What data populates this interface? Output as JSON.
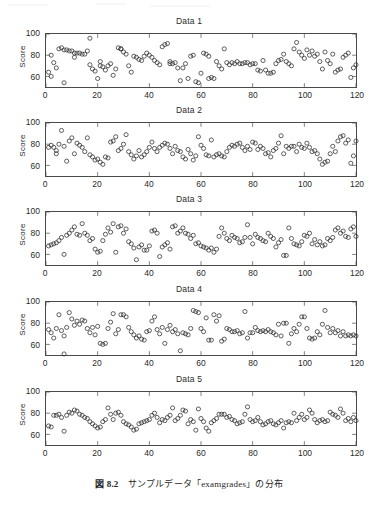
{
  "figure": {
    "caption_number": "図 8.2",
    "caption_text": "サンプルデータ「examgrades」の分布",
    "background_color": "#ffffff",
    "axis_color": "#4a4a4a",
    "marker_color": "#333333",
    "marker_shape": "open-circle"
  },
  "axis": {
    "ylabel": "Score",
    "yticks": [
      "60",
      "80",
      "100"
    ],
    "ytick_values": [
      60,
      80,
      100
    ],
    "xticks": [
      "0",
      "20",
      "40",
      "60",
      "80",
      "100",
      "120"
    ],
    "xtick_values": [
      0,
      20,
      40,
      60,
      80,
      100,
      120
    ],
    "xlim": [
      0,
      120
    ],
    "ylim": [
      50,
      100
    ],
    "grid": false
  },
  "chart_data": [
    {
      "type": "scatter",
      "title": "Data 1",
      "xlabel": "",
      "ylabel": "Score",
      "xlim": [
        0,
        120
      ],
      "ylim": [
        50,
        100
      ],
      "grid": false,
      "x": [
        1,
        2,
        2,
        3,
        4,
        5,
        6,
        7,
        7,
        8,
        9,
        10,
        11,
        11,
        12,
        13,
        14,
        15,
        16,
        17,
        17,
        18,
        19,
        20,
        21,
        21,
        22,
        23,
        24,
        25,
        26,
        27,
        28,
        29,
        29,
        30,
        31,
        32,
        33,
        34,
        35,
        36,
        37,
        38,
        39,
        40,
        41,
        42,
        43,
        44,
        45,
        46,
        47,
        48,
        48,
        49,
        50,
        51,
        52,
        53,
        54,
        55,
        56,
        57,
        58,
        59,
        60,
        61,
        62,
        63,
        63,
        64,
        65,
        66,
        67,
        68,
        69,
        70,
        71,
        72,
        73,
        74,
        75,
        76,
        77,
        78,
        79,
        80,
        81,
        82,
        83,
        84,
        85,
        86,
        87,
        88,
        89,
        90,
        91,
        92,
        93,
        94,
        95,
        96,
        97,
        98,
        99,
        100,
        101,
        102,
        103,
        104,
        105,
        106,
        107,
        108,
        109,
        110,
        111,
        112,
        113,
        114,
        115,
        116,
        117,
        118,
        119,
        120
      ],
      "y": [
        64,
        60,
        80,
        73,
        68,
        86,
        87,
        54,
        85,
        85,
        84,
        84,
        82,
        78,
        82,
        82,
        81,
        81,
        84,
        96,
        71,
        67,
        65,
        58,
        74,
        70,
        69,
        66,
        70,
        72,
        61,
        67,
        87,
        86,
        86,
        83,
        81,
        70,
        64,
        79,
        78,
        76,
        75,
        79,
        82,
        80,
        78,
        75,
        73,
        71,
        88,
        90,
        91,
        74,
        72,
        72,
        73,
        68,
        56,
        68,
        72,
        58,
        79,
        80,
        55,
        54,
        63,
        82,
        81,
        79,
        58,
        59,
        58,
        74,
        70,
        67,
        86,
        73,
        71,
        73,
        72,
        74,
        72,
        72,
        73,
        73,
        71,
        72,
        72,
        66,
        65,
        75,
        66,
        63,
        63,
        64,
        72,
        75,
        76,
        81,
        74,
        72,
        70,
        86,
        92,
        83,
        80,
        77,
        85,
        80,
        84,
        79,
        81,
        74,
        67,
        83,
        75,
        72,
        81,
        64,
        66,
        67,
        78,
        80,
        82,
        59,
        68,
        71
      ]
    },
    {
      "type": "scatter",
      "title": "Data 2",
      "xlabel": "",
      "ylabel": "Score",
      "xlim": [
        0,
        120
      ],
      "ylim": [
        50,
        100
      ],
      "grid": false,
      "x": [
        1,
        2,
        3,
        4,
        4,
        5,
        6,
        7,
        8,
        9,
        10,
        11,
        12,
        13,
        14,
        15,
        16,
        17,
        18,
        19,
        20,
        21,
        22,
        23,
        24,
        25,
        26,
        27,
        28,
        29,
        30,
        31,
        32,
        33,
        34,
        35,
        36,
        37,
        38,
        39,
        40,
        41,
        42,
        43,
        44,
        45,
        46,
        47,
        48,
        49,
        50,
        51,
        52,
        53,
        54,
        55,
        56,
        57,
        58,
        59,
        60,
        61,
        62,
        63,
        64,
        65,
        66,
        67,
        68,
        69,
        70,
        71,
        72,
        73,
        74,
        75,
        76,
        77,
        78,
        79,
        80,
        81,
        82,
        83,
        84,
        85,
        86,
        87,
        88,
        89,
        90,
        91,
        92,
        93,
        94,
        95,
        96,
        97,
        98,
        99,
        100,
        101,
        102,
        103,
        104,
        105,
        106,
        107,
        108,
        109,
        110,
        111,
        112,
        113,
        114,
        115,
        116,
        117,
        118,
        119,
        120
      ],
      "y": [
        77,
        79,
        77,
        74,
        71,
        80,
        93,
        78,
        64,
        83,
        86,
        71,
        81,
        79,
        77,
        73,
        86,
        70,
        68,
        65,
        66,
        63,
        61,
        68,
        67,
        82,
        83,
        87,
        74,
        76,
        80,
        89,
        73,
        70,
        66,
        69,
        74,
        68,
        70,
        73,
        77,
        82,
        76,
        73,
        77,
        79,
        81,
        80,
        76,
        71,
        78,
        74,
        73,
        68,
        66,
        75,
        71,
        65,
        69,
        87,
        79,
        76,
        70,
        69,
        84,
        68,
        70,
        71,
        69,
        68,
        73,
        77,
        79,
        78,
        80,
        81,
        77,
        74,
        78,
        75,
        82,
        81,
        75,
        78,
        76,
        71,
        72,
        68,
        74,
        76,
        81,
        88,
        71,
        78,
        76,
        78,
        78,
        73,
        80,
        77,
        76,
        81,
        77,
        73,
        74,
        71,
        66,
        61,
        63,
        64,
        71,
        78,
        73,
        83,
        87,
        88,
        81,
        84,
        62,
        69,
        83
      ]
    },
    {
      "type": "scatter",
      "title": "Data 3",
      "xlabel": "",
      "ylabel": "Score",
      "xlim": [
        0,
        120
      ],
      "ylim": [
        50,
        100
      ],
      "grid": false,
      "x": [
        1,
        2,
        3,
        4,
        5,
        6,
        7,
        8,
        9,
        10,
        11,
        12,
        13,
        14,
        15,
        16,
        17,
        18,
        19,
        20,
        21,
        22,
        23,
        24,
        25,
        26,
        27,
        28,
        29,
        30,
        31,
        32,
        33,
        34,
        35,
        36,
        37,
        38,
        39,
        40,
        41,
        42,
        43,
        44,
        45,
        46,
        47,
        48,
        49,
        50,
        51,
        52,
        53,
        54,
        55,
        56,
        57,
        58,
        59,
        60,
        61,
        62,
        63,
        64,
        65,
        66,
        67,
        68,
        69,
        70,
        71,
        72,
        73,
        74,
        75,
        76,
        77,
        78,
        79,
        80,
        81,
        82,
        83,
        84,
        85,
        86,
        87,
        88,
        89,
        90,
        91,
        92,
        93,
        94,
        95,
        96,
        97,
        98,
        99,
        100,
        101,
        102,
        103,
        104,
        105,
        106,
        107,
        108,
        109,
        110,
        111,
        112,
        113,
        114,
        115,
        116,
        117,
        118,
        119,
        120
      ],
      "y": [
        68,
        69,
        70,
        71,
        73,
        76,
        60,
        78,
        80,
        83,
        86,
        79,
        78,
        89,
        80,
        78,
        73,
        75,
        65,
        62,
        63,
        73,
        79,
        85,
        81,
        89,
        62,
        86,
        87,
        80,
        84,
        72,
        70,
        66,
        55,
        67,
        69,
        64,
        64,
        68,
        82,
        83,
        80,
        58,
        67,
        69,
        71,
        65,
        86,
        87,
        80,
        82,
        85,
        80,
        79,
        75,
        78,
        70,
        71,
        68,
        67,
        66,
        64,
        66,
        62,
        65,
        77,
        85,
        80,
        75,
        73,
        78,
        76,
        75,
        71,
        72,
        76,
        88,
        76,
        70,
        79,
        76,
        75,
        73,
        72,
        80,
        77,
        75,
        67,
        71,
        74,
        59,
        59,
        85,
        75,
        70,
        69,
        68,
        72,
        78,
        77,
        80,
        70,
        74,
        69,
        72,
        68,
        69,
        75,
        73,
        76,
        83,
        85,
        80,
        82,
        77,
        76,
        84,
        86,
        77
      ]
    },
    {
      "type": "scatter",
      "title": "Data 4",
      "xlabel": "",
      "ylabel": "Score",
      "xlim": [
        0,
        100
      ],
      "ylim": [
        50,
        100
      ],
      "grid": false,
      "x": [
        1,
        2,
        3,
        4,
        5,
        6,
        7,
        7,
        8,
        9,
        10,
        11,
        12,
        13,
        14,
        15,
        16,
        17,
        18,
        19,
        20,
        21,
        22,
        23,
        24,
        25,
        26,
        27,
        28,
        29,
        30,
        31,
        32,
        33,
        34,
        35,
        36,
        37,
        38,
        39,
        40,
        41,
        42,
        43,
        44,
        45,
        46,
        47,
        48,
        49,
        50,
        51,
        52,
        53,
        54,
        55,
        56,
        57,
        58,
        59,
        60,
        61,
        62,
        63,
        64,
        65,
        66,
        67,
        68,
        69,
        70,
        71,
        72,
        73,
        74,
        75,
        76,
        77,
        78,
        79,
        80,
        81,
        82,
        83,
        84,
        85,
        86,
        87,
        88,
        89,
        90,
        91,
        92,
        93,
        94,
        95,
        96,
        97,
        98,
        99,
        100,
        101,
        102,
        103,
        104,
        105,
        106,
        107,
        108,
        109,
        110,
        111,
        112,
        113,
        114,
        115,
        116,
        117,
        118,
        119,
        120
      ],
      "y": [
        74,
        71,
        66,
        75,
        88,
        73,
        68,
        51,
        76,
        90,
        84,
        78,
        82,
        79,
        83,
        82,
        75,
        71,
        76,
        69,
        77,
        61,
        60,
        61,
        75,
        81,
        89,
        70,
        74,
        88,
        88,
        86,
        76,
        72,
        69,
        66,
        68,
        65,
        64,
        72,
        73,
        82,
        86,
        74,
        70,
        76,
        61,
        74,
        78,
        72,
        74,
        70,
        54,
        71,
        70,
        69,
        75,
        92,
        91,
        90,
        75,
        72,
        85,
        64,
        64,
        88,
        82,
        87,
        63,
        65,
        75,
        74,
        72,
        72,
        73,
        70,
        71,
        91,
        66,
        71,
        71,
        76,
        73,
        72,
        73,
        72,
        74,
        72,
        71,
        69,
        79,
        68,
        80,
        80,
        61,
        70,
        75,
        72,
        79,
        86,
        86,
        75,
        66,
        65,
        66,
        72,
        69,
        79,
        92,
        76,
        71,
        75,
        71,
        73,
        68,
        72,
        68,
        69,
        68,
        69,
        68
      ]
    },
    {
      "type": "scatter",
      "title": "Data 5",
      "xlabel": "",
      "ylabel": "Score",
      "xlim": [
        0,
        100
      ],
      "ylim": [
        50,
        100
      ],
      "grid": false,
      "x": [
        1,
        2,
        3,
        4,
        5,
        6,
        7,
        8,
        9,
        10,
        11,
        12,
        13,
        14,
        15,
        16,
        17,
        18,
        19,
        20,
        21,
        22,
        23,
        24,
        25,
        26,
        27,
        28,
        29,
        30,
        31,
        32,
        33,
        34,
        35,
        36,
        37,
        38,
        39,
        40,
        41,
        42,
        43,
        44,
        45,
        46,
        47,
        48,
        49,
        50,
        51,
        52,
        53,
        54,
        55,
        56,
        57,
        58,
        59,
        60,
        61,
        62,
        63,
        64,
        65,
        66,
        67,
        68,
        69,
        70,
        71,
        72,
        73,
        74,
        75,
        76,
        77,
        78,
        79,
        80,
        81,
        82,
        83,
        84,
        85,
        86,
        87,
        88,
        89,
        90,
        91,
        92,
        93,
        94,
        95,
        96,
        97,
        98,
        99,
        100,
        101,
        102,
        103,
        104,
        105,
        106,
        107,
        108,
        109,
        110,
        111,
        112,
        113,
        114,
        115,
        116,
        117,
        118,
        119,
        120
      ],
      "y": [
        68,
        67,
        78,
        78,
        79,
        76,
        63,
        78,
        81,
        80,
        83,
        82,
        79,
        78,
        76,
        75,
        72,
        70,
        68,
        66,
        67,
        72,
        74,
        85,
        79,
        74,
        80,
        81,
        78,
        72,
        70,
        69,
        67,
        64,
        65,
        70,
        71,
        72,
        73,
        74,
        78,
        80,
        76,
        71,
        74,
        73,
        76,
        78,
        85,
        73,
        75,
        78,
        83,
        82,
        70,
        74,
        72,
        64,
        84,
        75,
        72,
        66,
        63,
        71,
        73,
        75,
        79,
        79,
        79,
        76,
        77,
        74,
        73,
        70,
        71,
        72,
        79,
        86,
        74,
        72,
        73,
        76,
        72,
        69,
        70,
        72,
        73,
        70,
        69,
        71,
        73,
        66,
        71,
        72,
        71,
        80,
        73,
        76,
        79,
        74,
        76,
        83,
        80,
        74,
        71,
        73,
        74,
        72,
        73,
        81,
        79,
        78,
        76,
        84,
        80,
        73,
        75,
        72,
        76,
        73
      ]
    }
  ]
}
